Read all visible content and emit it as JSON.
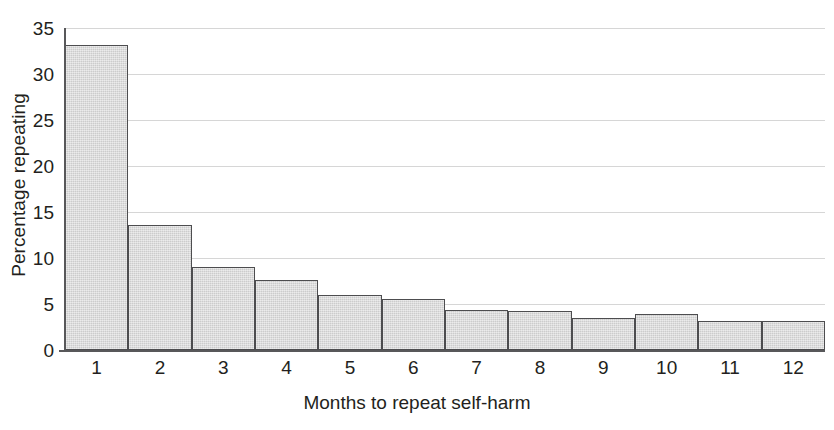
{
  "chart_data": {
    "type": "bar",
    "title": "",
    "subtitle": "",
    "xlabel": "Months to repeat self-harm",
    "ylabel": "Percentage repeating",
    "categories": [
      "1",
      "2",
      "3",
      "4",
      "5",
      "6",
      "7",
      "8",
      "9",
      "10",
      "11",
      "12"
    ],
    "values": [
      33.1,
      13.6,
      9.0,
      7.6,
      6.0,
      5.5,
      4.3,
      4.2,
      3.5,
      3.9,
      3.2,
      3.2
    ],
    "ylim": [
      0,
      35
    ],
    "ytick_values": [
      0,
      5,
      10,
      15,
      20,
      25,
      30,
      35
    ],
    "ytick_labels": [
      "0",
      "5",
      "10",
      "15",
      "20",
      "25",
      "30",
      "35"
    ],
    "grid": true,
    "grid_axis": "y",
    "legend": null,
    "legend_position": "none",
    "series": [
      {
        "name": "Percentage repeating",
        "values": [
          33.1,
          13.6,
          9.0,
          7.6,
          6.0,
          5.5,
          4.3,
          4.2,
          3.5,
          3.9,
          3.2,
          3.2
        ]
      }
    ],
    "annotations": []
  },
  "style": {
    "bar_fill": "#d3d3d3",
    "bar_border": "#4d4d4f",
    "grid_color": "#d6d6d6",
    "axis_color": "#58585a",
    "text_color": "#231f20",
    "background": "#ffffff"
  }
}
